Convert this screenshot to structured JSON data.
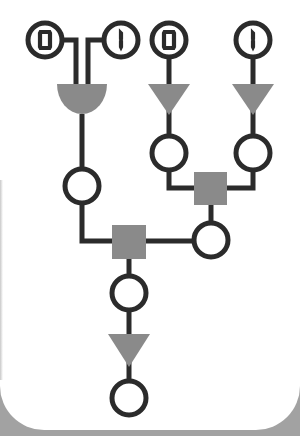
{
  "game": {
    "type": "logic-circuit-puzzle",
    "colors": {
      "background_frame": "#a2a2a2",
      "board": "#ffffff",
      "wire": "#2b2b2b",
      "gate_fill": "#8a8a8a"
    },
    "inputs": [
      {
        "id": "in1",
        "value": "0",
        "cx": 45,
        "cy": 40
      },
      {
        "id": "in2",
        "value": "1",
        "cx": 121,
        "cy": 40
      },
      {
        "id": "in3",
        "value": "0",
        "cx": 169,
        "cy": 40
      },
      {
        "id": "in4",
        "value": "1",
        "cx": 253,
        "cy": 40
      }
    ],
    "gates": [
      {
        "id": "and-gate",
        "kind": "and-semicircle",
        "inputs": [
          "in1",
          "in2"
        ]
      },
      {
        "id": "not-gate-1",
        "kind": "not-triangle",
        "input": "in3"
      },
      {
        "id": "not-gate-2",
        "kind": "not-triangle",
        "input": "in4"
      },
      {
        "id": "square-gate-upper",
        "kind": "square"
      },
      {
        "id": "square-gate-lower",
        "kind": "square"
      },
      {
        "id": "not-gate-3",
        "kind": "not-triangle"
      }
    ],
    "empty_slots": [
      {
        "id": "slot-left",
        "cx": 83,
        "cy": 186
      },
      {
        "id": "slot-mid-left",
        "cx": 169,
        "cy": 153
      },
      {
        "id": "slot-mid-right",
        "cx": 253,
        "cy": 153
      },
      {
        "id": "slot-right-lower",
        "cx": 211,
        "cy": 240
      },
      {
        "id": "slot-center",
        "cx": 129,
        "cy": 293
      },
      {
        "id": "slot-output",
        "cx": 129,
        "cy": 398
      }
    ]
  }
}
